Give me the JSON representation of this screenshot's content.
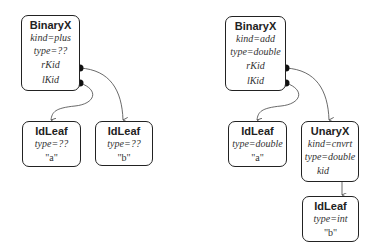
{
  "left_tree": {
    "root": {
      "title": "BinaryX",
      "kind": "kind=plus",
      "type": "type=??",
      "rkid": "rKid",
      "lkid": "lKid"
    },
    "left_leaf": {
      "title": "IdLeaf",
      "type": "type=??",
      "value": "\"a\""
    },
    "right_leaf": {
      "title": "IdLeaf",
      "type": "type=??",
      "value": "\"b\""
    }
  },
  "right_tree": {
    "root": {
      "title": "BinaryX",
      "kind": "kind=add",
      "type": "type=double",
      "rkid": "rKid",
      "lkid": "lKid"
    },
    "left_leaf": {
      "title": "IdLeaf",
      "type": "type=double",
      "value": "\"a\""
    },
    "unary": {
      "title": "UnaryX",
      "kind": "kind=cnvrt",
      "type": "type=double",
      "kid": "kid"
    },
    "unary_leaf": {
      "title": "IdLeaf",
      "type": "type=int",
      "value": "\"b\""
    }
  }
}
